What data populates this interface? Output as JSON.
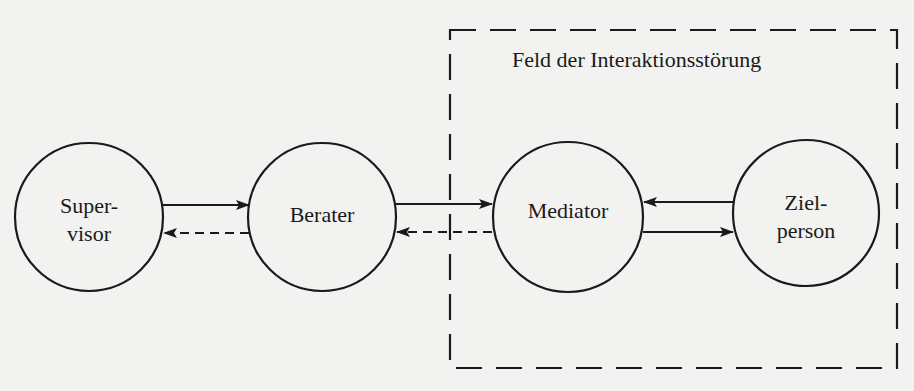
{
  "diagram": {
    "type": "flow-diagram",
    "field": {
      "label": "Feld der Interaktionsstörung",
      "border_style": "dashed"
    },
    "nodes": [
      {
        "id": "supervisor",
        "label_line1": "Super-",
        "label_line2": "visor",
        "shape": "circle"
      },
      {
        "id": "berater",
        "label_line1": "Berater",
        "label_line2": "",
        "shape": "circle"
      },
      {
        "id": "mediator",
        "label_line1": "Mediator",
        "label_line2": "",
        "shape": "circle"
      },
      {
        "id": "zielperson",
        "label_line1": "Ziel-",
        "label_line2": "person",
        "shape": "circle"
      }
    ],
    "edges": [
      {
        "from": "supervisor",
        "to": "berater",
        "style": "solid"
      },
      {
        "from": "berater",
        "to": "supervisor",
        "style": "dashed"
      },
      {
        "from": "berater",
        "to": "mediator",
        "style": "solid"
      },
      {
        "from": "mediator",
        "to": "berater",
        "style": "dashed"
      },
      {
        "from": "zielperson",
        "to": "mediator",
        "style": "solid"
      },
      {
        "from": "mediator",
        "to": "zielperson",
        "style": "solid"
      }
    ],
    "colors": {
      "ink": "#1a1a1a",
      "paper": "#f2f2f0"
    }
  }
}
